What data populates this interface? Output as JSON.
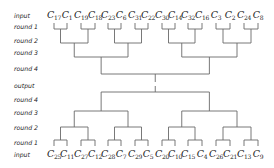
{
  "row_labels": {
    "top": [
      {
        "text": "input",
        "y": 15
      },
      {
        "text": "round 1",
        "y": 26
      },
      {
        "text": "round 2",
        "y": 40
      },
      {
        "text": "round 3",
        "y": 52
      },
      {
        "text": "round 4",
        "y": 68
      }
    ],
    "middle": {
      "text": "output",
      "y": 85
    },
    "bottom": [
      {
        "text": "round 4",
        "y": 99
      },
      {
        "text": "round 3",
        "y": 112
      },
      {
        "text": "round 2",
        "y": 127
      },
      {
        "text": "round 1",
        "y": 142
      },
      {
        "text": "input",
        "y": 154
      }
    ]
  },
  "top_tree": {
    "leaves": [
      "17",
      "1",
      "19",
      "18",
      "23",
      "6",
      "31",
      "22",
      "30",
      "14",
      "32",
      "16",
      "3",
      "2",
      "24",
      "8"
    ],
    "leaf_prefix": "C",
    "leaf_y": 15
  },
  "bottom_tree": {
    "leaves": [
      "25",
      "11",
      "27",
      "12",
      "28",
      "7",
      "29",
      "5",
      "20",
      "10",
      "15",
      "4",
      "26",
      "21",
      "13",
      "9"
    ],
    "leaf_prefix": "C",
    "leaf_y": 154
  },
  "layout": {
    "leaf_x": [
      54,
      67,
      81,
      95,
      108,
      121,
      135,
      148,
      162,
      175,
      188,
      202,
      216,
      230,
      244,
      258
    ],
    "top_levels_y": [
      23,
      29,
      43,
      57,
      74,
      82
    ],
    "bottom_levels_y": [
      146,
      140,
      127,
      111,
      92,
      86
    ],
    "line_color": "#6a6a6a"
  }
}
